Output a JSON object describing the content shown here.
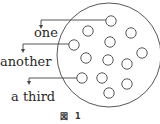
{
  "diagram": {
    "labels": [
      {
        "id": "one",
        "text": "one"
      },
      {
        "id": "another",
        "text": "another"
      },
      {
        "id": "third",
        "text": "a third"
      }
    ],
    "caption": {
      "prefix": "図",
      "number": "1"
    },
    "small_circle_count": 13,
    "colors": {
      "stroke": "#444444",
      "text": "#2a2a2a",
      "background": "#ffffff"
    }
  }
}
